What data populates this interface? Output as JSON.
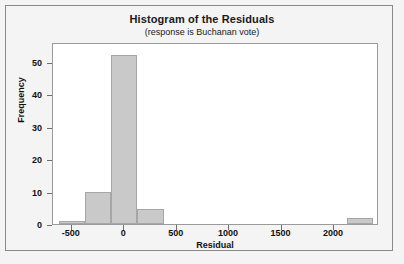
{
  "chart_data": {
    "type": "bar",
    "title": "Histogram of the Residuals",
    "subtitle": "(response is Buchanan vote)",
    "xlabel": "Residual",
    "ylabel": "Frequency",
    "grid": false,
    "legend": "none",
    "xlim": [
      -680,
      2430
    ],
    "ylim": [
      0,
      56
    ],
    "bin_width": 250,
    "xticks": [
      -500,
      0,
      500,
      1000,
      1500,
      2000
    ],
    "xtick_labels": [
      "-500",
      "0",
      "500",
      "1000",
      "1500",
      "2000"
    ],
    "yticks": [
      0,
      10,
      20,
      30,
      40,
      50
    ],
    "ytick_labels": [
      "0",
      "10",
      "20",
      "30",
      "40",
      "50"
    ],
    "bins": [
      {
        "left": -625,
        "right": -375,
        "center": -500,
        "value": 1
      },
      {
        "left": -375,
        "right": -125,
        "center": -250,
        "value": 10
      },
      {
        "left": -125,
        "right": 125,
        "center": 0,
        "value": 52
      },
      {
        "left": 125,
        "right": 375,
        "center": 250,
        "value": 4.5
      },
      {
        "left": 2125,
        "right": 2375,
        "center": 2250,
        "value": 2
      }
    ],
    "categories": [
      "-500",
      "-250",
      "0",
      "250",
      "2250"
    ],
    "values": [
      1,
      10,
      52,
      4.5,
      2
    ],
    "colors": {
      "bar_fill": "#c9c9c9",
      "bar_border": "#a6a6a6",
      "plot_background": "#ffffff",
      "figure_background": "#f4f4f4",
      "axis": "#6e6e6e",
      "text": "#111111"
    }
  }
}
